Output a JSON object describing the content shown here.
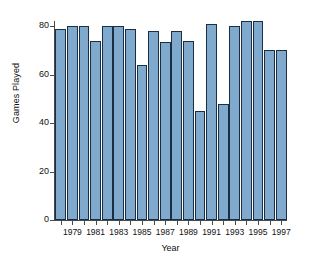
{
  "chart_data": {
    "type": "bar",
    "title": "",
    "xlabel": "Year",
    "ylabel": "Games Played",
    "categories": [
      1978,
      1979,
      1980,
      1981,
      1982,
      1983,
      1984,
      1985,
      1986,
      1987,
      1988,
      1989,
      1990,
      1991,
      1992,
      1993,
      1994,
      1995,
      1996,
      1997
    ],
    "values": [
      79,
      80,
      80,
      74,
      80,
      80,
      79,
      64,
      78,
      73.5,
      78,
      74,
      45,
      81,
      48,
      80,
      82,
      82,
      70,
      70
    ],
    "ylim": [
      0,
      85
    ],
    "xtick_labels": [
      "1979",
      "1981",
      "1983",
      "1985",
      "1987",
      "1989",
      "1991",
      "1993",
      "1995",
      "1997"
    ],
    "xtick_values": [
      1979,
      1981,
      1983,
      1985,
      1987,
      1989,
      1991,
      1993,
      1995,
      1997
    ],
    "ytick_labels": [
      "0",
      "20",
      "40",
      "60",
      "80"
    ],
    "ytick_values": [
      0,
      20,
      40,
      60,
      80
    ],
    "grid": false,
    "legend": false,
    "bar_color": "#7fa9cd",
    "bar_edge_color": "#1c2e44",
    "axis_color": "#4a4a4a",
    "background_color": "#ffffff"
  }
}
